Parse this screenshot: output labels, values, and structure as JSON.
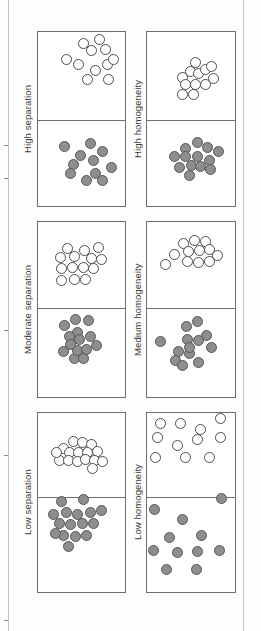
{
  "figure": {
    "title": "",
    "columns": [
      {
        "name": "separation",
        "labels": [
          "High separation",
          "Moderate separation",
          "Low separation"
        ]
      },
      {
        "name": "homogeneity",
        "labels": [
          "High homogeneity",
          "Medium homogeneity",
          "Low homogeneity"
        ]
      }
    ],
    "colors": {
      "open_fill": "#ffffff",
      "open_stroke": "#4d4d4d",
      "filled_fill": "#8e8e8e",
      "filled_stroke": "#575757",
      "panel_border": "#6e6e6e",
      "label_text": "#3a3a3a",
      "page_rule": "#c3c3c3"
    },
    "panel_geometry": {
      "column_x": [
        37,
        146
      ],
      "column_width": [
        89,
        90
      ],
      "group_top": [
        31,
        221,
        412
      ],
      "group_bottom": [
        207,
        398,
        593
      ],
      "divider_y": [
        120,
        308,
        497
      ],
      "label_x": [
        20,
        130
      ],
      "dot_diameter": 11
    }
  },
  "chart_data": {
    "type": "scatter",
    "title": "",
    "xlabel": "",
    "ylabel": "",
    "legend": [
      {
        "marker": "open-circle",
        "label": "Group A (open circles)"
      },
      {
        "marker": "filled-circle",
        "label": "Group B (filled gray circles)"
      }
    ],
    "panels": [
      {
        "id": "high-separation",
        "label": "High separation",
        "column": "separation",
        "row": 1,
        "open_count": 11,
        "filled_count": 11,
        "open_points": [
          [
            52,
            14
          ],
          [
            47,
            38
          ],
          [
            61,
            22
          ],
          [
            70,
            10
          ],
          [
            77,
            21
          ],
          [
            79,
            38
          ],
          [
            86,
            32
          ],
          [
            66,
            44
          ],
          [
            57,
            55
          ],
          [
            80,
            55
          ],
          [
            33,
            32
          ]
        ],
        "filled_points": [
          [
            49,
            41
          ],
          [
            31,
            30
          ],
          [
            41,
            51
          ],
          [
            60,
            27
          ],
          [
            63,
            47
          ],
          [
            74,
            36
          ],
          [
            84,
            55
          ],
          [
            56,
            70
          ],
          [
            74,
            70
          ],
          [
            38,
            62
          ],
          [
            66,
            62
          ]
        ]
      },
      {
        "id": "high-homogeneity",
        "label": "High homogeneity",
        "column": "homogeneity",
        "row": 1,
        "open_count": 12,
        "filled_count": 13,
        "open_points": [
          [
            40,
            52
          ],
          [
            49,
            46
          ],
          [
            58,
            48
          ],
          [
            55,
            35
          ],
          [
            66,
            43
          ],
          [
            75,
            53
          ],
          [
            44,
            60
          ],
          [
            55,
            60
          ],
          [
            66,
            60
          ],
          [
            40,
            71
          ],
          [
            53,
            71
          ],
          [
            73,
            40
          ]
        ],
        "filled_points": [
          [
            44,
            33
          ],
          [
            57,
            26
          ],
          [
            68,
            32
          ],
          [
            32,
            42
          ],
          [
            44,
            42
          ],
          [
            57,
            42
          ],
          [
            70,
            46
          ],
          [
            80,
            36
          ],
          [
            37,
            55
          ],
          [
            50,
            52
          ],
          [
            61,
            54
          ],
          [
            72,
            57
          ],
          [
            48,
            64
          ]
        ]
      },
      {
        "id": "moderate-separation",
        "label": "Moderate separation",
        "column": "separation",
        "row": 2,
        "open_count": 14,
        "filled_count": 14,
        "open_points": [
          [
            34,
            32
          ],
          [
            26,
            42
          ],
          [
            42,
            41
          ],
          [
            53,
            34
          ],
          [
            61,
            43
          ],
          [
            69,
            31
          ],
          [
            73,
            44
          ],
          [
            27,
            55
          ],
          [
            40,
            54
          ],
          [
            52,
            54
          ],
          [
            63,
            55
          ],
          [
            27,
            68
          ],
          [
            42,
            67
          ],
          [
            55,
            67
          ]
        ],
        "filled_points": [
          [
            31,
            19
          ],
          [
            43,
            13
          ],
          [
            58,
            14
          ],
          [
            45,
            27
          ],
          [
            36,
            32
          ],
          [
            48,
            35
          ],
          [
            60,
            32
          ],
          [
            67,
            42
          ],
          [
            30,
            48
          ],
          [
            42,
            56
          ],
          [
            52,
            56
          ],
          [
            45,
            47
          ],
          [
            56,
            46
          ],
          [
            38,
            41
          ]
        ]
      },
      {
        "id": "medium-homogeneity",
        "label": "Medium homogeneity",
        "column": "homogeneity",
        "row": 2,
        "open_count": 12,
        "filled_count": 13,
        "open_points": [
          [
            42,
            26
          ],
          [
            54,
            22
          ],
          [
            66,
            24
          ],
          [
            47,
            35
          ],
          [
            59,
            34
          ],
          [
            70,
            33
          ],
          [
            32,
            38
          ],
          [
            79,
            40
          ],
          [
            22,
            50
          ],
          [
            46,
            47
          ],
          [
            58,
            48
          ],
          [
            70,
            47
          ]
        ],
        "filled_points": [
          [
            45,
            20
          ],
          [
            57,
            15
          ],
          [
            67,
            31
          ],
          [
            16,
            37
          ],
          [
            46,
            35
          ],
          [
            58,
            36
          ],
          [
            73,
            44
          ],
          [
            36,
            48
          ],
          [
            48,
            50
          ],
          [
            33,
            58
          ],
          [
            58,
            60
          ],
          [
            40,
            64
          ],
          [
            48,
            44
          ]
        ]
      },
      {
        "id": "low-separation",
        "label": "Low separation",
        "column": "separation",
        "row": 3,
        "open_count": 16,
        "filled_count": 16,
        "open_points": [
          [
            30,
            43
          ],
          [
            41,
            35
          ],
          [
            51,
            36
          ],
          [
            61,
            38
          ],
          [
            36,
            48
          ],
          [
            47,
            48
          ],
          [
            57,
            48
          ],
          [
            68,
            47
          ],
          [
            25,
            57
          ],
          [
            35,
            57
          ],
          [
            45,
            58
          ],
          [
            55,
            56
          ],
          [
            65,
            57
          ],
          [
            74,
            58
          ],
          [
            22,
            48
          ],
          [
            62,
            66
          ]
        ],
        "filled_points": [
          [
            28,
            5
          ],
          [
            52,
            3
          ],
          [
            18,
            18
          ],
          [
            33,
            16
          ],
          [
            46,
            18
          ],
          [
            60,
            16
          ],
          [
            72,
            14
          ],
          [
            25,
            28
          ],
          [
            38,
            29
          ],
          [
            51,
            28
          ],
          [
            63,
            28
          ],
          [
            30,
            40
          ],
          [
            43,
            41
          ],
          [
            56,
            40
          ],
          [
            35,
            52
          ],
          [
            21,
            38
          ]
        ]
      },
      {
        "id": "low-homogeneity",
        "label": "Low homogeneity",
        "column": "homogeneity",
        "row": 3,
        "open_count": 11,
        "filled_count": 11,
        "open_points": [
          [
            16,
            13
          ],
          [
            38,
            13
          ],
          [
            61,
            20
          ],
          [
            83,
            8
          ],
          [
            13,
            30
          ],
          [
            57,
            32
          ],
          [
            83,
            30
          ],
          [
            35,
            39
          ],
          [
            11,
            54
          ],
          [
            44,
            53
          ],
          [
            71,
            54
          ]
        ],
        "filled_points": [
          [
            84,
            2
          ],
          [
            9,
            13
          ],
          [
            40,
            23
          ],
          [
            26,
            42
          ],
          [
            62,
            40
          ],
          [
            8,
            56
          ],
          [
            35,
            58
          ],
          [
            57,
            57
          ],
          [
            82,
            56
          ],
          [
            23,
            76
          ],
          [
            56,
            75
          ]
        ]
      }
    ]
  }
}
